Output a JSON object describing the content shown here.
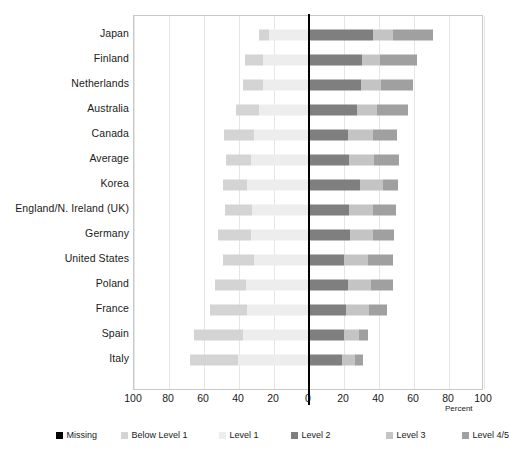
{
  "chart_data": {
    "type": "bar",
    "subtype": "diverging-stacked-bar",
    "title": "",
    "xlabel": "Percent",
    "ylabel": "",
    "xlim": [
      -100,
      100
    ],
    "xticks": [
      "100",
      "80",
      "60",
      "40",
      "20",
      "0",
      "20",
      "40",
      "60",
      "80",
      "100"
    ],
    "grid": true,
    "legend_position": "bottom",
    "legend": [
      {
        "name": "Missing",
        "color": "#000000"
      },
      {
        "name": "Below Level 1",
        "color": "#d4d4d4"
      },
      {
        "name": "Level 1",
        "color": "#ededed"
      },
      {
        "name": "Level 2",
        "color": "#7f7f7f"
      },
      {
        "name": "Level 3",
        "color": "#c4c4c4"
      },
      {
        "name": "Level 4/5",
        "color": "#a0a0a0"
      }
    ],
    "series_order": [
      "Below Level 1",
      "Level 1",
      "Level 2",
      "Level 3",
      "Level 4/5"
    ],
    "categories": [
      "Japan",
      "Finland",
      "Netherlands",
      "Australia",
      "Canada",
      "Average",
      "Korea",
      "England/N. Ireland (UK)",
      "Germany",
      "United States",
      "Poland",
      "France",
      "Spain",
      "Italy"
    ],
    "missing_label": "Missing",
    "missing": [
      "1.2",
      "0.0",
      "2.3",
      "1.9",
      "0.9",
      "1.2",
      "0.3",
      "1.4",
      "1.5",
      "4.2",
      "0.0",
      "0.8",
      "0.8",
      "0.7"
    ],
    "rows": [
      {
        "category": "Japan",
        "missing": 1.2,
        "below_level_1": 5.7,
        "level_1": 17.1,
        "level_2": 48.0,
        "level_3": 22.9,
        "level_4_5": 22.9
      },
      {
        "category": "Finland",
        "missing": 0.0,
        "below_level_1": 10.3,
        "level_1": 26.3,
        "level_2": 40.6,
        "level_3": 21.1,
        "level_4_5": 22.9
      },
      {
        "category": "Netherlands",
        "missing": 2.3,
        "below_level_1": 11.4,
        "level_1": 26.3,
        "level_2": 41.1,
        "level_3": 18.3,
        "level_4_5": 22.9
      },
      {
        "category": "Australia",
        "missing": 1.9,
        "below_level_1": 13.1,
        "level_1": 28.6,
        "level_2": 38.9,
        "level_3": 17.7,
        "level_4_5": 22.9
      },
      {
        "category": "Canada",
        "missing": 0.9,
        "below_level_1": 17.1,
        "level_1": 31.4,
        "level_2": 36.6,
        "level_3": 13.7,
        "level_4_5": 22.9
      },
      {
        "category": "Average",
        "missing": 1.2,
        "below_level_1": 14.3,
        "level_1": 33.1,
        "level_2": 37.1,
        "level_3": 14.3,
        "level_4_5": 22.9
      },
      {
        "category": "Korea",
        "missing": 0.3,
        "below_level_1": 13.7,
        "level_1": 35.4,
        "level_2": 42.3,
        "level_3": 8.6,
        "level_4_5": 22.9
      },
      {
        "category": "England/N. Ireland (UK)",
        "missing": 1.4,
        "below_level_1": 15.4,
        "level_1": 32.6,
        "level_2": 36.6,
        "level_3": 13.1,
        "level_4_5": 22.9
      },
      {
        "category": "Germany",
        "missing": 1.5,
        "below_level_1": 18.9,
        "level_1": 33.1,
        "level_2": 36.6,
        "level_3": 12.0,
        "level_4_5": 22.9
      },
      {
        "category": "United States",
        "missing": 4.2,
        "below_level_1": 17.7,
        "level_1": 31.4,
        "level_2": 33.7,
        "level_3": 14.3,
        "level_4_5": 22.9
      },
      {
        "category": "Poland",
        "missing": 0.0,
        "below_level_1": 17.7,
        "level_1": 36.0,
        "level_2": 35.4,
        "level_3": 12.6,
        "level_4_5": 22.9
      },
      {
        "category": "France",
        "missing": 0.8,
        "below_level_1": 21.1,
        "level_1": 35.4,
        "level_2": 34.3,
        "level_3": 10.3,
        "level_4_5": 22.9
      },
      {
        "category": "Spain",
        "missing": 0.8,
        "below_level_1": 28.0,
        "level_1": 37.7,
        "level_2": 28.6,
        "level_3": 5.1,
        "level_4_5": 22.9
      },
      {
        "category": "Italy",
        "missing": 0.7,
        "below_level_1": 30.3,
        "level_1": 40.6,
        "level_2": 26.3,
        "level_3": 4.6,
        "level_4_5": 22.9
      }
    ],
    "geometry_note": "Bars are diverging: Below Level 1 + Level 1 + left part of Level 2 extend left of zero; right part of Level 2 + Level 3 + Level 4/5 extend right.",
    "bars_px": [
      {
        "left_start": -28.6,
        "l1_start": -22.9,
        "l3_start": 36.6,
        "l45_start": 48.0,
        "right_end": 70.9
      },
      {
        "left_start": -36.6,
        "l1_start": -26.3,
        "l3_start": 30.0,
        "l45_start": 40.6,
        "right_end": 61.7
      },
      {
        "left_start": -37.7,
        "l1_start": -26.3,
        "l3_start": 29.7,
        "l45_start": 41.1,
        "right_end": 59.4
      },
      {
        "left_start": -41.7,
        "l1_start": -28.6,
        "l3_start": 27.4,
        "l45_start": 38.9,
        "right_end": 56.6
      },
      {
        "left_start": -48.6,
        "l1_start": -31.4,
        "l3_start": 22.3,
        "l45_start": 36.6,
        "right_end": 50.3
      },
      {
        "left_start": -47.4,
        "l1_start": -33.1,
        "l3_start": 22.9,
        "l45_start": 37.1,
        "right_end": 51.4
      },
      {
        "left_start": -49.1,
        "l1_start": -35.4,
        "l3_start": 29.1,
        "l45_start": 42.3,
        "right_end": 50.9
      },
      {
        "left_start": -48.0,
        "l1_start": -32.6,
        "l3_start": 22.9,
        "l45_start": 36.6,
        "right_end": 49.7
      },
      {
        "left_start": -52.0,
        "l1_start": -33.1,
        "l3_start": 23.4,
        "l45_start": 36.6,
        "right_end": 48.6
      },
      {
        "left_start": -49.1,
        "l1_start": -31.4,
        "l3_start": 20.0,
        "l45_start": 33.7,
        "right_end": 48.0
      },
      {
        "left_start": -53.7,
        "l1_start": -36.0,
        "l3_start": 22.3,
        "l45_start": 35.4,
        "right_end": 48.0
      },
      {
        "left_start": -56.6,
        "l1_start": -35.4,
        "l3_start": 21.1,
        "l45_start": 34.3,
        "right_end": 44.6
      },
      {
        "left_start": -65.7,
        "l1_start": -37.7,
        "l3_start": 20.0,
        "l45_start": 28.6,
        "right_end": 33.7
      },
      {
        "left_start": -68.0,
        "l1_start": -40.6,
        "l3_start": 18.9,
        "l45_start": 26.3,
        "right_end": 30.9
      }
    ]
  }
}
